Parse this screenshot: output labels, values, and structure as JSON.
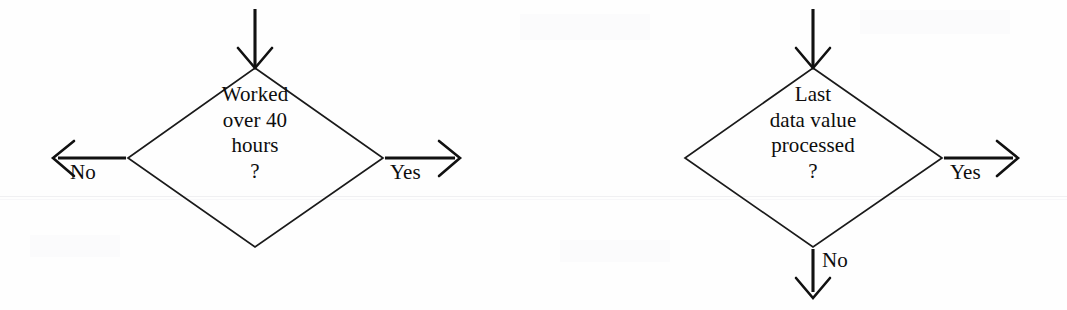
{
  "figure": {
    "type": "flowchart",
    "background_color": "#fefefe",
    "ink_color": "#111111",
    "rule_color": "#f0f0f2"
  },
  "nodes": [
    {
      "id": "worked-over-40-hours",
      "shape": "diamond",
      "lines": [
        "Worked",
        "over 40",
        "hours",
        "?"
      ],
      "text": "Worked over 40 hours ?"
    },
    {
      "id": "last-data-value-processed",
      "shape": "diamond",
      "lines": [
        "Last",
        "data value",
        "processed",
        "?"
      ],
      "text": "Last data value processed ?"
    }
  ],
  "edges": [
    {
      "id": "left-diamond-inbound",
      "label": "",
      "direction": "down",
      "arrowhead": "open"
    },
    {
      "id": "left-diamond-no",
      "label": "No",
      "direction": "left",
      "arrowhead": "open"
    },
    {
      "id": "left-diamond-yes",
      "label": "Yes",
      "direction": "right",
      "arrowhead": "open"
    },
    {
      "id": "right-diamond-inbound",
      "label": "",
      "direction": "down",
      "arrowhead": "open"
    },
    {
      "id": "right-diamond-yes",
      "label": "Yes",
      "direction": "right",
      "arrowhead": "open"
    },
    {
      "id": "right-diamond-no",
      "label": "No",
      "direction": "down",
      "arrowhead": "open"
    }
  ]
}
